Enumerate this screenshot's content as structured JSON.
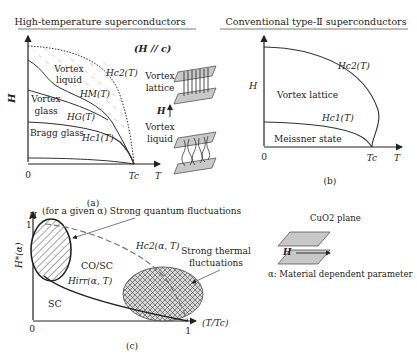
{
  "panel_a": {
    "title": "High-temperature superconductors",
    "field_dir": "(H // c)",
    "y_axis": "H",
    "x_axis": "T",
    "origin": "0",
    "tc": "Tc",
    "regions": {
      "vortex_liquid": [
        "Vortex",
        "liquid"
      ],
      "vortex_glass": [
        "Vortex",
        "glass"
      ],
      "bragg_glass": "Bragg glass"
    },
    "curves": {
      "hc2": "Hc2(T)",
      "hm": "HM(T)",
      "hg": "HG(T)",
      "hc1": "Hc1(T)"
    },
    "caption": "(a)",
    "inset": {
      "top_label": [
        "Vortex",
        "lattice"
      ],
      "arrow_label": "H",
      "bottom_label": [
        "Vortex",
        "liquid"
      ],
      "bottom_axis": "T"
    }
  },
  "panel_b": {
    "title": "Conventional type-Ⅱ superconductors",
    "y_axis": "H",
    "x_axis": "T",
    "origin": "0",
    "tc": "Tc",
    "regions": {
      "vortex_lattice": "Vortex lattice",
      "meissner": "Meissner state"
    },
    "curves": {
      "hc2": "Hc2(T)",
      "hc1": "Hc1(T)"
    },
    "caption": "(b)"
  },
  "panel_c": {
    "y_axis_top": "H",
    "y_axis": "H*(α)",
    "x_axis": "(T/Tc)",
    "origin": "0",
    "y_tick": "1",
    "x_tick": "1",
    "annotation_quantum": "(for a given α) Strong quantum fluctuations",
    "annotation_thermal": [
      "Strong thermal",
      "fluctuations"
    ],
    "curves": {
      "hc2": "Hc2(α,  T)",
      "hirr": "Hirr(α,  T)"
    },
    "regions": {
      "co_sc": "CO/SC",
      "sc": "SC"
    },
    "caption": "(c)",
    "inset": {
      "plane_label": "CuO2 plane",
      "arrow_label": "H",
      "alpha_note": "α:  Material dependent parameter"
    }
  }
}
